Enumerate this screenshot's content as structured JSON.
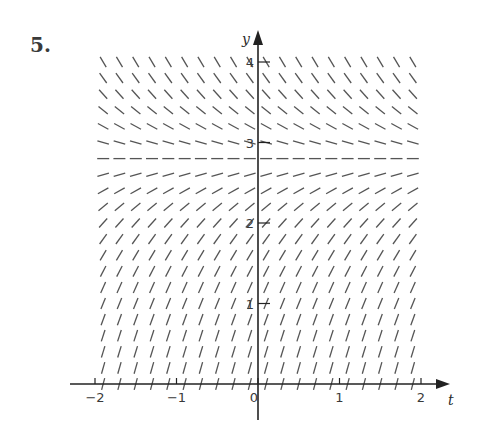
{
  "problem": {
    "number": "5."
  },
  "chart_data": {
    "type": "slope_field",
    "title": "",
    "xlabel": "t",
    "ylabel": "y",
    "xlim": [
      -2,
      2
    ],
    "ylim": [
      0,
      4
    ],
    "x_ticks": [
      {
        "value": -2,
        "label": "−2"
      },
      {
        "value": -1,
        "label": "−1"
      },
      {
        "value": 0,
        "label": "0"
      },
      {
        "value": 1,
        "label": "1"
      },
      {
        "value": 2,
        "label": "2"
      }
    ],
    "y_ticks": [
      {
        "value": 1,
        "label": "1"
      },
      {
        "value": 2,
        "label": "2"
      },
      {
        "value": 3,
        "label": "3"
      },
      {
        "value": 4,
        "label": "4"
      }
    ],
    "grid": false,
    "field": {
      "t_start": -2,
      "t_end": 1.9,
      "t_step": 0.2,
      "y_start": 0,
      "y_end": 4,
      "y_step": 0.2,
      "equilibrium_y": 2.8,
      "slope_model": "dy/dt = k*(2.8 - y)",
      "k": 1.4,
      "description": "Slopes depend only on y: steep positive near y=0, horizontal at y≈2.8, negative above"
    },
    "colors": {
      "segments": "#555555",
      "axes": "#222222",
      "text": "#3a3a3a"
    }
  },
  "layout": {
    "origin_px": [
      258,
      384
    ],
    "px_per_unit_x": 81.5,
    "px_per_unit_y": 80.5,
    "segment_length_px": 12
  }
}
